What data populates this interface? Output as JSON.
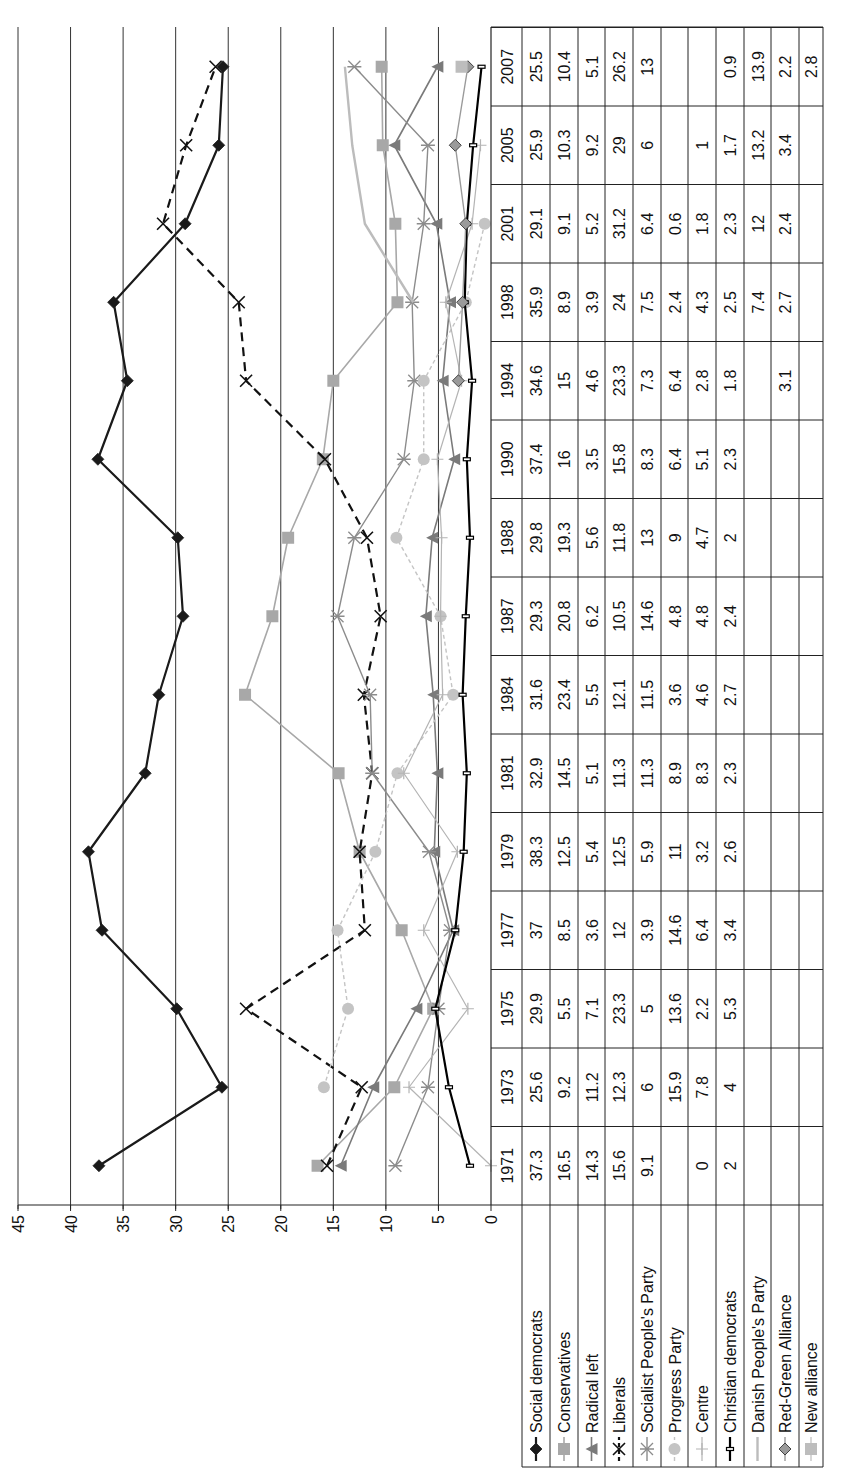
{
  "chart_data": {
    "type": "line",
    "title": "",
    "xlabel": "",
    "ylabel": "",
    "ylim": [
      0,
      45
    ],
    "yticks": [
      0,
      5,
      10,
      15,
      20,
      25,
      30,
      35,
      40,
      45
    ],
    "grid": "horizontal major gridlines",
    "legend_position": "data table with legend keys (below plot)",
    "orientation_note": "figure rotated 90 degrees counter-clockwise on page",
    "categories": [
      "1971",
      "1973",
      "1975",
      "1977",
      "1979",
      "1981",
      "1984",
      "1987",
      "1988",
      "1990",
      "1994",
      "1998",
      "2001",
      "2005",
      "2007"
    ],
    "series": [
      {
        "name": "Social democrats",
        "color": "#1a1a1a",
        "marker": "diamond",
        "dash": "solid",
        "width": 2.2,
        "values": [
          37.3,
          25.6,
          29.9,
          37,
          38.3,
          32.9,
          31.6,
          29.3,
          29.8,
          37.4,
          34.6,
          35.9,
          29.1,
          25.9,
          25.5
        ]
      },
      {
        "name": "Conservatives",
        "color": "#a8a8a8",
        "marker": "square",
        "dash": "solid",
        "width": 1.6,
        "values": [
          16.5,
          9.2,
          5.5,
          8.5,
          12.5,
          14.5,
          23.4,
          20.8,
          19.3,
          16,
          15,
          8.9,
          9.1,
          10.3,
          10.4
        ]
      },
      {
        "name": "Radical left",
        "color": "#7a7a7a",
        "marker": "triangle",
        "dash": "solid",
        "width": 1.6,
        "values": [
          14.3,
          11.2,
          7.1,
          3.6,
          5.4,
          5.1,
          5.5,
          6.2,
          5.6,
          3.5,
          4.6,
          3.9,
          5.2,
          9.2,
          5.1
        ]
      },
      {
        "name": "Liberals",
        "color": "#111111",
        "marker": "x",
        "dash": "9,6",
        "width": 2.2,
        "values": [
          15.6,
          12.3,
          23.3,
          12,
          12.5,
          11.3,
          12.1,
          10.5,
          11.8,
          15.8,
          23.3,
          24,
          31.2,
          29,
          26.2
        ]
      },
      {
        "name": "Socialist People's Party",
        "color": "#8c8c8c",
        "marker": "star",
        "dash": "solid",
        "width": 1.4,
        "values": [
          9.1,
          6,
          5,
          3.9,
          5.9,
          11.3,
          11.5,
          14.6,
          13,
          8.3,
          7.3,
          7.5,
          6.4,
          6,
          13
        ]
      },
      {
        "name": "Progress Party",
        "color": "#c4c4c4",
        "marker": "circle",
        "dash": "4,3",
        "width": 1.4,
        "values": [
          null,
          15.9,
          13.6,
          14.6,
          11,
          8.9,
          3.6,
          4.8,
          9,
          6.4,
          6.4,
          2.4,
          0.6,
          null,
          null
        ]
      },
      {
        "name": "Centre",
        "color": "#b4b4b4",
        "marker": "plus",
        "dash": "solid",
        "width": 1.2,
        "values": [
          0,
          7.8,
          2.2,
          6.4,
          3.2,
          8.3,
          4.6,
          4.8,
          4.7,
          5.1,
          2.8,
          4.3,
          1.8,
          1,
          null
        ]
      },
      {
        "name": "Christian democrats",
        "color": "#000000",
        "marker": "dash",
        "dash": "solid",
        "width": 2.2,
        "values": [
          2,
          4,
          5.3,
          3.4,
          2.6,
          2.3,
          2.7,
          2.4,
          2,
          2.3,
          1.8,
          2.5,
          2.3,
          1.7,
          0.9
        ]
      },
      {
        "name": "Danish People's Party",
        "color": "#bcbcbc",
        "marker": "none",
        "dash": "solid",
        "width": 2.4,
        "values": [
          null,
          null,
          null,
          null,
          null,
          null,
          null,
          null,
          null,
          null,
          null,
          7.4,
          12,
          13.2,
          13.9
        ]
      },
      {
        "name": "Red-Green Alliance",
        "color": "#9a9a9a",
        "marker": "diamond",
        "dash": "solid",
        "width": 1.4,
        "values": [
          null,
          null,
          null,
          null,
          null,
          null,
          null,
          null,
          null,
          null,
          3.1,
          2.7,
          2.4,
          3.4,
          2.2
        ]
      },
      {
        "name": "New alliance",
        "color": "#bdbdbd",
        "marker": "square",
        "dash": "solid",
        "width": 1.2,
        "values": [
          null,
          null,
          null,
          null,
          null,
          null,
          null,
          null,
          null,
          null,
          null,
          null,
          null,
          null,
          2.8
        ]
      }
    ]
  },
  "table": {
    "cells": [
      [
        "37.3",
        "25.6",
        "29.9",
        "37",
        "38.3",
        "32.9",
        "31.6",
        "29.3",
        "29.8",
        "37.4",
        "34.6",
        "35.9",
        "29.1",
        "25.9",
        "25.5"
      ],
      [
        "16.5",
        "9.2",
        "5.5",
        "8.5",
        "12.5",
        "14.5",
        "23.4",
        "20.8",
        "19.3",
        "16",
        "15",
        "8.9",
        "9.1",
        "10.3",
        "10.4"
      ],
      [
        "14.3",
        "11.2",
        "7.1",
        "3.6",
        "5.4",
        "5.1",
        "5.5",
        "6.2",
        "5.6",
        "3.5",
        "4.6",
        "3.9",
        "5.2",
        "9.2",
        "5.1"
      ],
      [
        "15.6",
        "12.3",
        "23.3",
        "12",
        "12.5",
        "11.3",
        "12.1",
        "10.5",
        "11.8",
        "15.8",
        "23.3",
        "24",
        "31.2",
        "29",
        "26.2"
      ],
      [
        "9.1",
        "6",
        "5",
        "3.9",
        "5.9",
        "11.3",
        "11.5",
        "14.6",
        "13",
        "8.3",
        "7.3",
        "7.5",
        "6.4",
        "6",
        "13"
      ],
      [
        "",
        "15.9",
        "13.6",
        "14.6",
        "11",
        "8.9",
        "3.6",
        "4.8",
        "9",
        "6.4",
        "6.4",
        "2.4",
        "0.6",
        "",
        ""
      ],
      [
        "0",
        "7.8",
        "2.2",
        "6.4",
        "3.2",
        "8.3",
        "4.6",
        "4.8",
        "4.7",
        "5.1",
        "2.8",
        "4.3",
        "1.8",
        "1",
        ""
      ],
      [
        "2",
        "4",
        "5.3",
        "3.4",
        "2.6",
        "2.3",
        "2.7",
        "2.4",
        "2",
        "2.3",
        "1.8",
        "2.5",
        "2.3",
        "1.7",
        "0.9"
      ],
      [
        "",
        "",
        "",
        "",
        "",
        "",
        "",
        "",
        "",
        "",
        "",
        "7.4",
        "12",
        "13.2",
        "13.9"
      ],
      [
        "",
        "",
        "",
        "",
        "",
        "",
        "",
        "",
        "",
        "",
        "3.1",
        "2.7",
        "2.4",
        "3.4",
        "2.2"
      ],
      [
        "",
        "",
        "",
        "",
        "",
        "",
        "",
        "",
        "",
        "",
        "",
        "",
        "",
        "",
        "2.8"
      ]
    ]
  }
}
